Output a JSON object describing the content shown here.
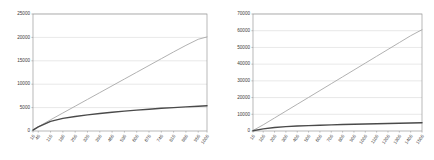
{
  "figure": {
    "background_color": "#ffffff",
    "panel_count": 2
  },
  "chart_data": [
    {
      "id": "left-chart",
      "type": "line",
      "title": "",
      "subtitle": "",
      "xlabel": "",
      "ylabel": "",
      "grid": true,
      "grid_axis": "y",
      "legend": "none",
      "xlim": [
        10,
        1000
      ],
      "ylim": [
        0,
        25000
      ],
      "yticks": [
        0,
        5000,
        10000,
        15000,
        20000,
        25000
      ],
      "ytick_labels": [
        "0",
        "5000",
        "10000",
        "15000",
        "20000",
        "25000"
      ],
      "x": [
        10,
        40,
        110,
        180,
        250,
        320,
        390,
        460,
        530,
        600,
        670,
        740,
        810,
        880,
        950,
        1000
      ],
      "xtick_labels": [
        "10",
        "40",
        "110",
        "180",
        "250",
        "320",
        "390",
        "460",
        "530",
        "600",
        "670",
        "740",
        "810",
        "880",
        "950",
        "1000"
      ],
      "series": [
        {
          "name": "upper-series",
          "color": "#a8a8a8",
          "width": 0.9,
          "values": [
            250,
            900,
            2400,
            3850,
            5300,
            6750,
            8200,
            9650,
            11100,
            12550,
            14000,
            15450,
            16900,
            18300,
            19600,
            20100
          ]
        },
        {
          "name": "lower-series",
          "color": "#4a4a4a",
          "width": 1.4,
          "values": [
            200,
            900,
            2050,
            2700,
            3100,
            3450,
            3750,
            4000,
            4250,
            4450,
            4650,
            4850,
            5000,
            5150,
            5300,
            5400
          ]
        }
      ]
    },
    {
      "id": "right-chart",
      "type": "line",
      "title": "",
      "subtitle": "",
      "xlabel": "",
      "ylabel": "",
      "grid": true,
      "grid_axis": "y",
      "legend": "none",
      "xlim": [
        10,
        1500
      ],
      "ylim": [
        0,
        70000
      ],
      "yticks": [
        0,
        10000,
        20000,
        30000,
        40000,
        50000,
        60000,
        70000
      ],
      "ytick_labels": [
        "0",
        "10000",
        "20000",
        "30000",
        "40000",
        "50000",
        "60000",
        "70000"
      ],
      "x": [
        10,
        100,
        200,
        300,
        400,
        500,
        600,
        700,
        800,
        900,
        1000,
        1100,
        1200,
        1300,
        1400,
        1500
      ],
      "xtick_labels": [
        "10",
        "100",
        "200",
        "300",
        "400",
        "500",
        "600",
        "700",
        "800",
        "900",
        "1000",
        "1100",
        "1200",
        "1300",
        "1400",
        "1500"
      ],
      "series": [
        {
          "name": "upper-series",
          "color": "#a8a8a8",
          "width": 0.9,
          "values": [
            300,
            3700,
            7800,
            11900,
            16000,
            20100,
            24200,
            28300,
            32400,
            36500,
            40600,
            44700,
            48800,
            52900,
            57000,
            60600
          ]
        },
        {
          "name": "lower-series",
          "color": "#4a4a4a",
          "width": 1.4,
          "values": [
            150,
            1300,
            2100,
            2600,
            2950,
            3200,
            3450,
            3650,
            3850,
            4000,
            4150,
            4300,
            4450,
            4600,
            4750,
            4900
          ]
        }
      ]
    }
  ]
}
